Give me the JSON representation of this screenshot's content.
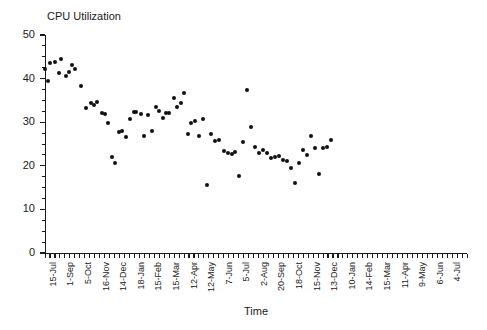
{
  "chart_data": {
    "type": "scatter",
    "title": "CPU Utilization",
    "xlabel": "Time",
    "ylabel": "",
    "ylim": [
      0,
      50
    ],
    "y_ticks": [
      0,
      10,
      20,
      30,
      40,
      50
    ],
    "y_minor_step": 2.5,
    "grid": false,
    "legend": null,
    "marker": {
      "shape": "circle",
      "color": "#111111",
      "size_px": 4
    },
    "x_tick_labels": [
      "15-Jul",
      "1-Sep",
      "5-Oct",
      "16-Nov",
      "14-Dec",
      "18-Jan",
      "15-Feb",
      "15-Mar",
      "12-Apr",
      "12-May",
      "7-Jun",
      "5-Jul",
      "2-Aug",
      "20-Sep",
      "18-Oct",
      "15-Nov",
      "13-Dec",
      "10-Jan",
      "14-Feb",
      "15-Mar",
      "11-Apr",
      "9-May",
      "6-Jun",
      "4-Jul"
    ],
    "x_minor_ticks_total": 85,
    "points": [
      {
        "x": 0.0,
        "y": 42.2
      },
      {
        "x": 0.6,
        "y": 39.4
      },
      {
        "x": 1.1,
        "y": 43.6
      },
      {
        "x": 2.1,
        "y": 43.8
      },
      {
        "x": 2.8,
        "y": 41.2
      },
      {
        "x": 3.3,
        "y": 44.6
      },
      {
        "x": 4.3,
        "y": 40.6
      },
      {
        "x": 4.9,
        "y": 41.6
      },
      {
        "x": 5.5,
        "y": 43.2
      },
      {
        "x": 6.1,
        "y": 42.1
      },
      {
        "x": 7.2,
        "y": 38.4
      },
      {
        "x": 8.3,
        "y": 33.3
      },
      {
        "x": 9.2,
        "y": 34.5
      },
      {
        "x": 9.8,
        "y": 33.9
      },
      {
        "x": 10.4,
        "y": 34.6
      },
      {
        "x": 11.5,
        "y": 32.0
      },
      {
        "x": 12.1,
        "y": 31.9
      },
      {
        "x": 12.7,
        "y": 29.9
      },
      {
        "x": 13.4,
        "y": 22.1
      },
      {
        "x": 14.2,
        "y": 20.7
      },
      {
        "x": 14.9,
        "y": 27.8
      },
      {
        "x": 15.6,
        "y": 28.0
      },
      {
        "x": 16.3,
        "y": 26.7
      },
      {
        "x": 17.2,
        "y": 30.8
      },
      {
        "x": 17.9,
        "y": 32.3
      },
      {
        "x": 18.4,
        "y": 32.4
      },
      {
        "x": 19.3,
        "y": 31.9
      },
      {
        "x": 20.0,
        "y": 26.8
      },
      {
        "x": 20.8,
        "y": 31.7
      },
      {
        "x": 21.5,
        "y": 27.9
      },
      {
        "x": 22.3,
        "y": 33.4
      },
      {
        "x": 22.9,
        "y": 32.6
      },
      {
        "x": 23.7,
        "y": 30.9
      },
      {
        "x": 24.4,
        "y": 32.1
      },
      {
        "x": 25.0,
        "y": 32.2
      },
      {
        "x": 25.9,
        "y": 35.6
      },
      {
        "x": 26.6,
        "y": 33.4
      },
      {
        "x": 27.3,
        "y": 34.5
      },
      {
        "x": 28.0,
        "y": 36.7
      },
      {
        "x": 28.8,
        "y": 27.4
      },
      {
        "x": 29.5,
        "y": 29.8
      },
      {
        "x": 30.2,
        "y": 30.2
      },
      {
        "x": 31.0,
        "y": 26.8
      },
      {
        "x": 31.8,
        "y": 30.7
      },
      {
        "x": 32.6,
        "y": 15.7
      },
      {
        "x": 33.5,
        "y": 27.2
      },
      {
        "x": 34.3,
        "y": 25.6
      },
      {
        "x": 35.1,
        "y": 26.0
      },
      {
        "x": 36.0,
        "y": 23.4
      },
      {
        "x": 36.8,
        "y": 22.9
      },
      {
        "x": 37.6,
        "y": 22.8
      },
      {
        "x": 38.3,
        "y": 23.2
      },
      {
        "x": 39.1,
        "y": 17.6
      },
      {
        "x": 39.9,
        "y": 25.5
      },
      {
        "x": 40.7,
        "y": 37.5
      },
      {
        "x": 41.5,
        "y": 29.0
      },
      {
        "x": 42.3,
        "y": 24.2
      },
      {
        "x": 43.1,
        "y": 22.9
      },
      {
        "x": 43.9,
        "y": 23.6
      },
      {
        "x": 44.7,
        "y": 23.0
      },
      {
        "x": 45.5,
        "y": 21.9
      },
      {
        "x": 46.3,
        "y": 22.0
      },
      {
        "x": 47.1,
        "y": 22.2
      },
      {
        "x": 47.9,
        "y": 21.3
      },
      {
        "x": 48.7,
        "y": 21.0
      },
      {
        "x": 49.5,
        "y": 19.6
      },
      {
        "x": 50.3,
        "y": 16.0
      },
      {
        "x": 51.2,
        "y": 20.7
      },
      {
        "x": 52.0,
        "y": 23.6
      },
      {
        "x": 52.8,
        "y": 22.5
      },
      {
        "x": 53.6,
        "y": 26.9
      },
      {
        "x": 54.4,
        "y": 24.0
      },
      {
        "x": 55.2,
        "y": 18.1
      },
      {
        "x": 56.0,
        "y": 24.1
      },
      {
        "x": 56.9,
        "y": 24.3
      },
      {
        "x": 57.7,
        "y": 26.0
      }
    ]
  }
}
